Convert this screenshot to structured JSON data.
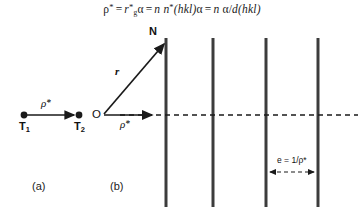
{
  "figure": {
    "width": 364,
    "height": 207,
    "background": "#ffffff",
    "ink": "#1a1a1a"
  },
  "formula": {
    "rho_star": "ρ",
    "star1": "*",
    "eq1": "=",
    "r": "r",
    "r_sup": "*",
    "r_sub": "g",
    "alpha1": "α",
    "eq2": "=",
    "n1": "n",
    "n2": "n",
    "n2_sup": "*",
    "hkl1": "(hkl)",
    "alpha2": "α",
    "eq3": "=",
    "n3": "n",
    "alpha3": "α",
    "slash": "/",
    "d": "d",
    "hkl2": "(hkl)",
    "plain_text": "ρ* = r*g α = n n*(hkl) α = n α/d(hkl)"
  },
  "panel_a": {
    "caption": "(a)",
    "point_left_label": "T",
    "point_left_sub": "1",
    "point_right_label": "T",
    "point_right_sub": "2",
    "vector_label": "ρ",
    "vector_label_star": "*",
    "geometry": {
      "dot_left": [
        24,
        115
      ],
      "dot_right": [
        79,
        115
      ],
      "arrow_from": [
        26,
        115
      ],
      "arrow_to": [
        74,
        115
      ]
    }
  },
  "panel_b": {
    "caption": "(b)",
    "origin_label": "O",
    "normal_label": "N",
    "vector_r_label": "r",
    "vector_rho_label": "ρ",
    "vector_rho_star": "*",
    "spacing_label": "e = 1/ρ*",
    "geometry": {
      "origin": [
        104,
        115
      ],
      "normal_tip": [
        166,
        42
      ],
      "rho_tip": [
        155,
        115
      ],
      "dashed_axis_y": 115,
      "dashed_axis_x1": 120,
      "dashed_axis_x2": 358,
      "plane_lines_x": [
        166,
        213,
        266,
        318
      ],
      "plane_top_y": 38,
      "plane_bottom_y": 205,
      "dim_arrow_y": 172,
      "dim_arrow_x1": 266,
      "dim_arrow_x2": 318
    }
  },
  "colors": {
    "line": "#1a1a1a",
    "plane": "#3c3c3c",
    "dashed": "#1a1a1a",
    "text": "#111111"
  }
}
